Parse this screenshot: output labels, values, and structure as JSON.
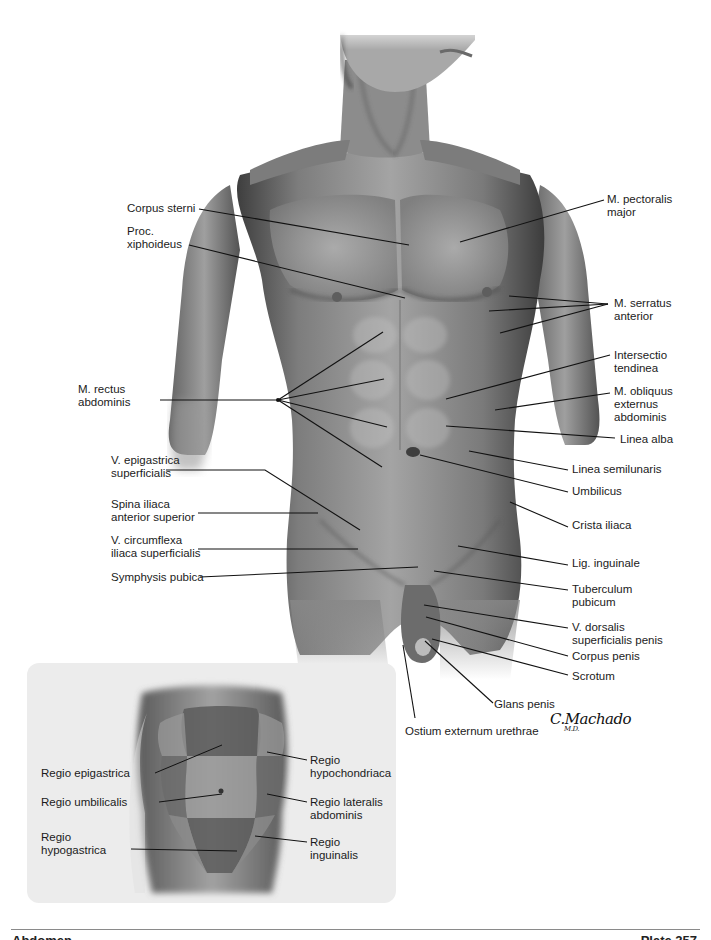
{
  "figure": {
    "labels_left": [
      {
        "id": "corpus-sterni",
        "text": "Corpus sterni",
        "x": 127,
        "y": 202
      },
      {
        "id": "proc-xiphoideus",
        "text": "Proc.\nxiphoideus",
        "x": 127,
        "y": 225
      },
      {
        "id": "m-rectus-abdominis",
        "text": "M. rectus\nabdominis",
        "x": 78,
        "y": 383
      },
      {
        "id": "v-epigastrica-superficialis",
        "text": "V. epigastrica\nsuperficialis",
        "x": 111,
        "y": 454
      },
      {
        "id": "spina-iliaca-anterior-superior",
        "text": "Spina iliaca\nanterior superior",
        "x": 111,
        "y": 498
      },
      {
        "id": "v-circumflexa-iliaca-superficialis",
        "text": "V. circumflexa\niliaca superficialis",
        "x": 111,
        "y": 534
      },
      {
        "id": "symphysis-pubica",
        "text": "Symphysis pubica",
        "x": 111,
        "y": 571
      }
    ],
    "labels_right": [
      {
        "id": "m-pectoralis-major",
        "text": "M. pectoralis\nmajor",
        "x": 607,
        "y": 193
      },
      {
        "id": "m-serratus-anterior",
        "text": "M. serratus\nanterior",
        "x": 614,
        "y": 297
      },
      {
        "id": "intersectio-tendinea",
        "text": "Intersectio\ntendinea",
        "x": 614,
        "y": 349
      },
      {
        "id": "m-obliquus-externus-abdominis",
        "text": "M. obliquus\nexternus\nabdominis",
        "x": 614,
        "y": 385
      },
      {
        "id": "linea-alba",
        "text": "Linea alba",
        "x": 620,
        "y": 433
      },
      {
        "id": "linea-semilunaris",
        "text": "Linea semilunaris",
        "x": 572,
        "y": 463
      },
      {
        "id": "umbilicus",
        "text": "Umbilicus",
        "x": 572,
        "y": 485
      },
      {
        "id": "crista-iliaca",
        "text": "Crista iliaca",
        "x": 572,
        "y": 519
      },
      {
        "id": "lig-inguinale",
        "text": "Lig. inguinale",
        "x": 572,
        "y": 557
      },
      {
        "id": "tuberculum-pubicum",
        "text": "Tuberculum\npubicum",
        "x": 572,
        "y": 583
      },
      {
        "id": "v-dorsalis-superficialis-penis",
        "text": "V. dorsalis\nsuperficialis penis",
        "x": 572,
        "y": 621
      },
      {
        "id": "corpus-penis",
        "text": "Corpus penis",
        "x": 572,
        "y": 650
      },
      {
        "id": "scrotum",
        "text": "Scrotum",
        "x": 572,
        "y": 670
      },
      {
        "id": "glans-penis",
        "text": "Glans penis",
        "x": 494,
        "y": 698
      },
      {
        "id": "ostium-externum-urethrae",
        "text": "Ostium externum urethrae",
        "x": 405,
        "y": 725
      }
    ],
    "signature": {
      "name": "C.Machado",
      "suffix": "M.D."
    }
  },
  "inset": {
    "title": "Regiones abdominis",
    "labels": [
      {
        "id": "regio-epigastrica",
        "text": "Regio epigastrica",
        "x": 14,
        "y": 104
      },
      {
        "id": "regio-umbilicalis",
        "text": "Regio umbilicalis",
        "x": 14,
        "y": 136
      },
      {
        "id": "regio-hypogastrica",
        "text": "Regio\nhypogastrica",
        "x": 14,
        "y": 168
      },
      {
        "id": "regio-hypochondriaca",
        "text": "Regio\nhypochondriaca",
        "x": 283,
        "y": 91
      },
      {
        "id": "regio-lateralis-abdominis",
        "text": "Regio lateralis\nabdominis",
        "x": 283,
        "y": 133
      },
      {
        "id": "regio-inguinalis",
        "text": "Regio\ninguinalis",
        "x": 283,
        "y": 173
      }
    ]
  },
  "footer": {
    "left_text": "Abdomen",
    "right_text": "Plate 257"
  },
  "colors": {
    "skin_mid": "#8a8a8a",
    "skin_dark": "#4a4a4a",
    "skin_light": "#bdbdbd",
    "leader_line": "#111111",
    "inset_bg": "#ececec",
    "region_fill": "#5e5e5e"
  }
}
